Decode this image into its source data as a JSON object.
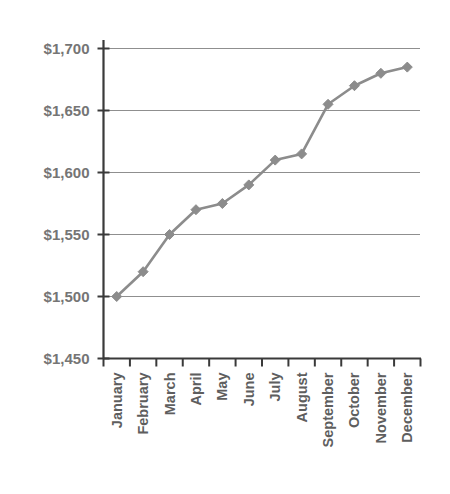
{
  "chart_data": {
    "type": "line",
    "title": "",
    "subtitle": "",
    "xlabel": "",
    "ylabel": "",
    "categories": [
      "January",
      "February",
      "March",
      "April",
      "May",
      "June",
      "July",
      "August",
      "September",
      "October",
      "November",
      "December"
    ],
    "series": [
      {
        "name": "",
        "values": [
          1500,
          1520,
          1550,
          1570,
          1575,
          1590,
          1610,
          1615,
          1655,
          1670,
          1680,
          1685
        ],
        "color": "#8c8c8c",
        "marker": "diamond"
      }
    ],
    "ylim": [
      1450,
      1700
    ],
    "ytick_values": [
      1450,
      1500,
      1550,
      1600,
      1650,
      1700
    ],
    "ytick_labels": [
      "$1,450",
      "$1,500",
      "$1,550",
      "$1,600",
      "$1,650",
      "$1,700"
    ],
    "grid": true,
    "grid_axis": "y",
    "legend": false,
    "legend_position": "none",
    "xtick_rotation": 90,
    "annotations": []
  },
  "colors": {
    "series": "#8c8c8c",
    "gridline": "#8f8f8f",
    "axis": "#3a3a3a",
    "ylabel_text": "#757575",
    "xlabel_text": "#5e5e5e",
    "background": "#ffffff"
  }
}
